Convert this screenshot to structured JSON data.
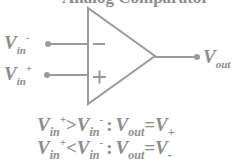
{
  "title": "Analog Comparator",
  "diagram": {
    "component": "comparator-op-amp",
    "inputs": [
      {
        "name": "V",
        "sub": "in",
        "sup": "-",
        "pin_symbol": "−"
      },
      {
        "name": "V",
        "sub": "in",
        "sup": "+",
        "pin_symbol": "+"
      }
    ],
    "output": {
      "name": "V",
      "sub": "out"
    },
    "colors": {
      "stroke": "#9a9a9a",
      "text": "#8c8c8c",
      "background": "#ffffff"
    }
  },
  "equations": [
    {
      "lhs": {
        "name": "V",
        "sub": "in",
        "sup": "+"
      },
      "op": ">",
      "rhs": {
        "name": "V",
        "sub": "in",
        "sup": "-"
      },
      "sep": ":",
      "result_name": "V",
      "result_sub": "out",
      "eq": "=",
      "value_name": "V",
      "value_sub": "+"
    },
    {
      "lhs": {
        "name": "V",
        "sub": "in",
        "sup": "+"
      },
      "op": "<",
      "rhs": {
        "name": "V",
        "sub": "in",
        "sup": "-"
      },
      "sep": ":",
      "result_name": "V",
      "result_sub": "out",
      "eq": "=",
      "value_name": "V",
      "value_sub": "-"
    }
  ]
}
